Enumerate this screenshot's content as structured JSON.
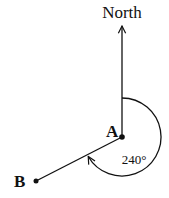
{
  "diagram": {
    "type": "bearing",
    "north_label": "North",
    "point_a_label": "A",
    "point_b_label": "B",
    "bearing_label": "240°",
    "bearing_degrees": 240,
    "line_color": "#111111"
  }
}
